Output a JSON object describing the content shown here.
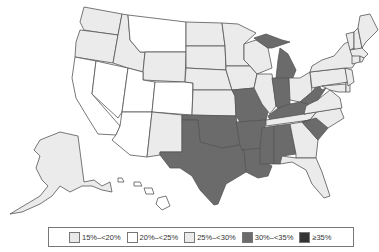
{
  "map": {
    "title": "",
    "colors": {
      "c15_20": "#e9e9e9",
      "c20_25": "#ffffff",
      "c25_30": "#ebebeb",
      "c30_35": "#6b6b6b",
      "c35": "#333333",
      "stroke": "#555555"
    },
    "categories_by_state": {
      "WA": "25-30",
      "OR": "25-30",
      "CA": "20-25",
      "NV": "20-25",
      "ID": "25-30",
      "MT": "20-25",
      "WY": "25-30",
      "UT": "20-25",
      "CO": "20-25",
      "AZ": "20-25",
      "NM": "25-30",
      "ND": "25-30",
      "SD": "25-30",
      "NE": "25-30",
      "KS": "25-30",
      "OK": "30-35",
      "TX": "30-35",
      "MN": "25-30",
      "IA": "25-30",
      "MO": "30-35",
      "AR": "30-35",
      "LA": "30-35",
      "WI": "25-30",
      "IL": "25-30",
      "MI": "30-35",
      "IN": "30-35",
      "OH": "25-30",
      "KY": "30-35",
      "TN": "25-30",
      "MS": "30-35",
      "AL": "30-35",
      "GA": "25-30",
      "FL": "25-30",
      "SC": "30-35",
      "NC": "25-30",
      "VA": "25-30",
      "WV": "30-35",
      "PA": "25-30",
      "NY": "25-30",
      "VT": "25-30",
      "NH": "25-30",
      "ME": "25-30",
      "MA": "25-30",
      "CT": "25-30",
      "RI": "25-30",
      "NJ": "25-30",
      "DE": "25-30",
      "MD": "25-30",
      "DC": "25-30",
      "AK": "25-30",
      "HI": "20-25"
    }
  },
  "legend": {
    "items": [
      {
        "label": "15%–<20%",
        "color": "#e9e9e9"
      },
      {
        "label": "20%–<25%",
        "color": "#ffffff"
      },
      {
        "label": "25%–<30%",
        "color": "#ebebeb"
      },
      {
        "label": "30%–<35%",
        "color": "#6b6b6b"
      },
      {
        "label": "≥35%",
        "color": "#333333"
      }
    ]
  }
}
